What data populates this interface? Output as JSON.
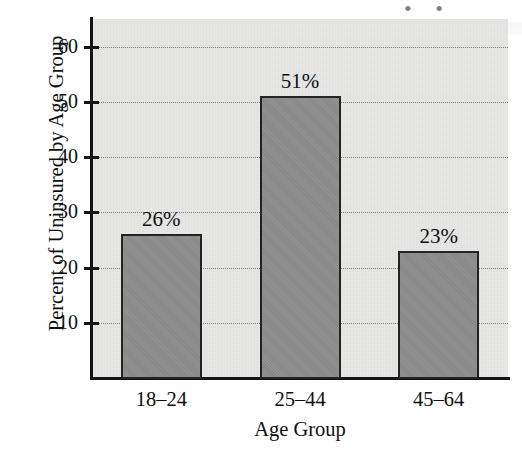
{
  "chart_data": {
    "type": "bar",
    "title": "",
    "xlabel": "Age Group",
    "ylabel": "Percent of Uninsured by Age Group",
    "categories": [
      "18–24",
      "25–44",
      "45–64"
    ],
    "values": [
      26,
      51,
      23
    ],
    "value_labels": [
      "26%",
      "51%",
      "23%"
    ],
    "ylim": [
      0,
      65
    ],
    "yticks": [
      10,
      20,
      30,
      40,
      50,
      60
    ],
    "ytick_labels": [
      "10",
      "20",
      "30",
      "40",
      "50",
      "60"
    ],
    "grid": true,
    "grid_style": "dotted-horizontal",
    "legend": "none",
    "bar_color": "#8c8c8c",
    "bar_edge_color": "#232323",
    "panel_color": "#e7e7e6",
    "axis_color": "#151515"
  },
  "artifact": {
    "top_right_bleed": "• •"
  }
}
